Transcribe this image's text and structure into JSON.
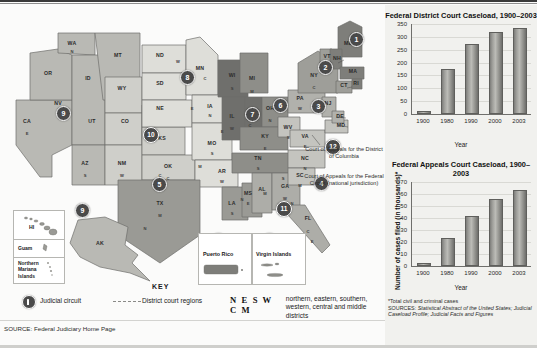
{
  "map": {
    "title": "US Federal Judicial Circuits Map",
    "states": [
      {
        "abbr": "WA",
        "x": 72,
        "y": 40
      },
      {
        "abbr": "OR",
        "x": 48,
        "y": 70
      },
      {
        "abbr": "CA",
        "x": 27,
        "y": 118
      },
      {
        "abbr": "NV",
        "x": 58,
        "y": 100
      },
      {
        "abbr": "ID",
        "x": 88,
        "y": 75
      },
      {
        "abbr": "MT",
        "x": 118,
        "y": 52
      },
      {
        "abbr": "WY",
        "x": 122,
        "y": 85
      },
      {
        "abbr": "UT",
        "x": 92,
        "y": 118
      },
      {
        "abbr": "CO",
        "x": 125,
        "y": 118
      },
      {
        "abbr": "AZ",
        "x": 85,
        "y": 160
      },
      {
        "abbr": "NM",
        "x": 122,
        "y": 160
      },
      {
        "abbr": "ND",
        "x": 160,
        "y": 52
      },
      {
        "abbr": "SD",
        "x": 160,
        "y": 80
      },
      {
        "abbr": "NE",
        "x": 160,
        "y": 105
      },
      {
        "abbr": "KS",
        "x": 162,
        "y": 135
      },
      {
        "abbr": "OK",
        "x": 168,
        "y": 163
      },
      {
        "abbr": "TX",
        "x": 160,
        "y": 200
      },
      {
        "abbr": "MN",
        "x": 200,
        "y": 65
      },
      {
        "abbr": "IA",
        "x": 210,
        "y": 103
      },
      {
        "abbr": "MO",
        "x": 212,
        "y": 140
      },
      {
        "abbr": "AR",
        "x": 222,
        "y": 168
      },
      {
        "abbr": "LA",
        "x": 232,
        "y": 200
      },
      {
        "abbr": "MS",
        "x": 248,
        "y": 190
      },
      {
        "abbr": "AL",
        "x": 262,
        "y": 186
      },
      {
        "abbr": "WI",
        "x": 232,
        "y": 72
      },
      {
        "abbr": "IL",
        "x": 232,
        "y": 113
      },
      {
        "abbr": "IN",
        "x": 250,
        "y": 110
      },
      {
        "abbr": "MI",
        "x": 252,
        "y": 75
      },
      {
        "abbr": "OH",
        "x": 270,
        "y": 105
      },
      {
        "abbr": "KY",
        "x": 265,
        "y": 133
      },
      {
        "abbr": "TN",
        "x": 258,
        "y": 155
      },
      {
        "abbr": "GA",
        "x": 285,
        "y": 183
      },
      {
        "abbr": "FL",
        "x": 308,
        "y": 215
      },
      {
        "abbr": "SC",
        "x": 300,
        "y": 172
      },
      {
        "abbr": "NC",
        "x": 305,
        "y": 155
      },
      {
        "abbr": "VA",
        "x": 305,
        "y": 133
      },
      {
        "abbr": "WV",
        "x": 288,
        "y": 124
      },
      {
        "abbr": "PA",
        "x": 300,
        "y": 95
      },
      {
        "abbr": "NY",
        "x": 314,
        "y": 72
      },
      {
        "abbr": "ME",
        "x": 348,
        "y": 40
      },
      {
        "abbr": "VT",
        "x": 327,
        "y": 53
      },
      {
        "abbr": "NH",
        "x": 337,
        "y": 55
      },
      {
        "abbr": "MA",
        "x": 353,
        "y": 68
      },
      {
        "abbr": "CT",
        "x": 344,
        "y": 82
      },
      {
        "abbr": "RI",
        "x": 356,
        "y": 80
      },
      {
        "abbr": "NJ",
        "x": 328,
        "y": 100
      },
      {
        "abbr": "DE",
        "x": 340,
        "y": 113
      },
      {
        "abbr": "MD",
        "x": 341,
        "y": 122
      },
      {
        "abbr": "AK",
        "x": 100,
        "y": 240
      },
      {
        "abbr": "HI",
        "x": 36,
        "y": 222
      }
    ],
    "district_letters": [
      "N",
      "E",
      "S",
      "W",
      "C",
      "M"
    ],
    "circuits": [
      {
        "num": "1",
        "x": 349,
        "y": 27
      },
      {
        "num": "2",
        "x": 318,
        "y": 55
      },
      {
        "num": "3",
        "x": 311,
        "y": 94
      },
      {
        "num": "4",
        "x": 314,
        "y": 171
      },
      {
        "num": "5",
        "x": 152,
        "y": 172
      },
      {
        "num": "6",
        "x": 273,
        "y": 93
      },
      {
        "num": "7",
        "x": 245,
        "y": 102
      },
      {
        "num": "8",
        "x": 180,
        "y": 65
      },
      {
        "num": "9",
        "x": 56,
        "y": 101
      },
      {
        "num": "10",
        "x": 143,
        "y": 122
      },
      {
        "num": "11",
        "x": 276,
        "y": 196
      },
      {
        "num": "12",
        "x": 325,
        "y": 134
      },
      {
        "num": "9b",
        "label": "9",
        "x": 75,
        "y": 198
      },
      {
        "num": "1b",
        "label": "1",
        "x": 211,
        "y": 228
      },
      {
        "num": "3b",
        "label": "3",
        "x": 262,
        "y": 228
      }
    ],
    "annotations": [
      {
        "id": "dc",
        "text": "Court of Appeals for the District of Columbia",
        "x": 307,
        "y": 143,
        "w": 80
      },
      {
        "id": "federal",
        "text": "Court of Appeals for the Federal Circuit (national jurisdiction)",
        "x": 307,
        "y": 170,
        "w": 80
      }
    ],
    "insets": [
      {
        "label": "HI"
      },
      {
        "label": "Guam"
      },
      {
        "label": "Northern Mariana Islands"
      },
      {
        "label": "Puerto Rico"
      },
      {
        "label": "Virgin Islands"
      },
      {
        "label": "AK"
      }
    ]
  },
  "key": {
    "title": "KEY",
    "judicial_circuit": "Judicial circuit",
    "district_court_regions": "District court regions",
    "neswcm": "N E S W C M",
    "neswcm_desc": "northern, eastern, southern, western, central and middle districts"
  },
  "source_line": "SOURCE: Federal Judiciary Home Page",
  "footnotes": {
    "asterisk": "*Total civil and criminal cases",
    "sources_label": "SOURCES: ",
    "sources_text": "Statistical Abstract of the United States; Judicial Caseload Profile; Judicial Facts and Figures"
  },
  "chart_data": [
    {
      "id": "district-court",
      "type": "bar",
      "title": "Federal District Court Caseload, 1900–2003",
      "categories": [
        "1900",
        "1980",
        "1990",
        "2000",
        "2003"
      ],
      "values": [
        5,
        168,
        265,
        312,
        325
      ],
      "xlabel": "Year",
      "ylabel": "Number of cases filed (in thousands)*",
      "ylim": [
        0,
        350
      ],
      "yticks": [
        0,
        50,
        100,
        150,
        200,
        250,
        300,
        350
      ],
      "grid": true,
      "legend": "none"
    },
    {
      "id": "appeals-court",
      "type": "bar",
      "title": "Federal Appeals Court Caseload, 1900–2003",
      "categories": [
        "1900",
        "1980",
        "1990",
        "2000",
        "2003"
      ],
      "values": [
        1,
        22,
        40,
        54,
        62
      ],
      "xlabel": "Year",
      "ylabel": "Number of cases filed (in thousands)*",
      "ylim": [
        0,
        70
      ],
      "yticks": [
        0,
        10,
        20,
        30,
        40,
        50,
        60,
        70
      ],
      "grid": true,
      "legend": "none"
    }
  ]
}
